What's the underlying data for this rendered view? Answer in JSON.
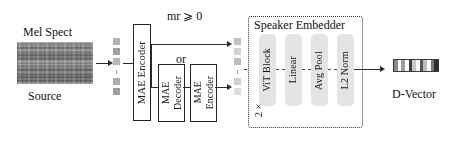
{
  "figure": {
    "type": "architecture-diagram"
  },
  "input": {
    "top_label": "Mel Spect",
    "bottom_label": "Source",
    "image_name": "mel-spectrogram-thumbnail"
  },
  "tokens_input": {
    "count": 5,
    "ellipsis_index": 2,
    "colors": [
      "#b4b4b4",
      "#a0a0a0",
      "#b8b8b8",
      "#adadad",
      "#9e9e9e"
    ]
  },
  "encoder": {
    "label": "MAE Encoder"
  },
  "branch": {
    "condition_label": "mr ⩾ 0",
    "or_label": "or",
    "decoder_label_line1": "MAE",
    "decoder_label_line2": "Decoder",
    "encoder_label_line1": "MAE",
    "encoder_label_line2": "Encoder"
  },
  "tokens_mid": {
    "count": 5,
    "ellipsis_index": 2,
    "colors": [
      "#c2c2c2",
      "#d2d2d2",
      "#bdbdbd",
      "#cfcfcf",
      "#dcdcdc"
    ]
  },
  "speaker_embedder": {
    "title": "Speaker Embedder",
    "repeat_label": "2×",
    "blocks": [
      {
        "label": "ViT Block"
      },
      {
        "label": "Linear"
      },
      {
        "label": "Avg Pool"
      },
      {
        "label": "L2 Norm"
      }
    ]
  },
  "output": {
    "label": "D-Vector",
    "segments": [
      "#8a8a8a",
      "#ffffff",
      "#9c9c9c",
      "#ffffff",
      "#3f3f3f",
      "#c8c8c8",
      "#ffffff",
      "#555555",
      "#bdbdbd",
      "#ffffff",
      "#7a7a7a",
      "#2e2e2e"
    ]
  },
  "colors": {
    "stroke": "#222222",
    "block_fill": "#e4e4e4",
    "background": "#ffffff"
  }
}
